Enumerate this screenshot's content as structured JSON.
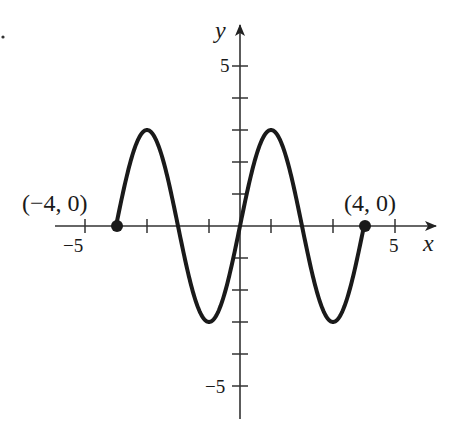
{
  "chart_data": {
    "type": "line",
    "title": "",
    "xlabel": "x",
    "ylabel": "y",
    "xlim": [
      -6.1,
      6.3
    ],
    "ylim": [
      -6.0,
      6.0
    ],
    "grid": false,
    "legend": null,
    "function": "y = 3 sin(pi x / 2)",
    "domain": [
      -4,
      4
    ],
    "x_ticks": [
      -5,
      -3,
      -1,
      1,
      3,
      5
    ],
    "x_tick_labels": [
      {
        "value": -5,
        "label": "−5"
      },
      {
        "value": 5,
        "label": "5"
      }
    ],
    "y_ticks": [
      -5,
      -4,
      -3,
      -2,
      -1,
      1,
      2,
      3,
      4,
      5
    ],
    "y_tick_labels": [
      {
        "value": 5,
        "label": "5"
      },
      {
        "value": -5,
        "label": "−5"
      }
    ],
    "series": [
      {
        "name": "curve",
        "x": [
          -4,
          -3.5,
          -3,
          -2.5,
          -2,
          -1.5,
          -1,
          -0.5,
          0,
          0.5,
          1,
          1.5,
          2,
          2.5,
          3,
          3.5,
          4
        ],
        "y": [
          0,
          2.12,
          3,
          2.12,
          0,
          -2.12,
          -3,
          -2.12,
          0,
          2.12,
          3,
          2.12,
          0,
          -2.12,
          -3,
          -2.12,
          0
        ]
      }
    ],
    "endpoints": [
      {
        "x": -4,
        "y": 0,
        "label": "(−4, 0)"
      },
      {
        "x": 4,
        "y": 0,
        "label": "(4, 0)"
      }
    ],
    "annotations": [
      "(−4, 0)",
      "(4, 0)"
    ],
    "colors": {
      "curve": "#1a1a1a",
      "axes": "#333333",
      "background": "#ffffff"
    }
  },
  "labels": {
    "x_axis": "x",
    "y_axis": "y",
    "x_neg5": "−5",
    "x_pos5": "5",
    "y_pos5": "5",
    "y_neg5": "−5",
    "left_point": "(−4, 0)",
    "right_point": "(4, 0)"
  }
}
